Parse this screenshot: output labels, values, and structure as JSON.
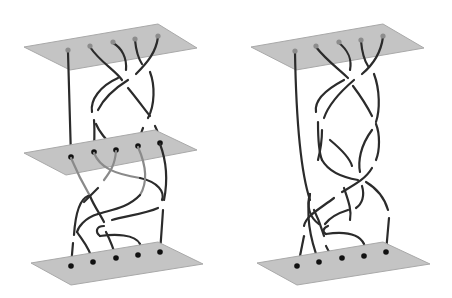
{
  "figure": {
    "colors": {
      "plate": "#c4c4c4",
      "plate_edge": "#a9a9a9",
      "strand": "#2b2b2b",
      "top_endpoint": "#8c8c8c",
      "endpoint": "#111111",
      "background": "#ffffff"
    },
    "panels": [
      {
        "id": "left",
        "plates": [
          "top",
          "middle",
          "bottom"
        ],
        "strand_count": 5
      },
      {
        "id": "right",
        "plates": [
          "top",
          "bottom"
        ],
        "strand_count": 5
      }
    ]
  }
}
